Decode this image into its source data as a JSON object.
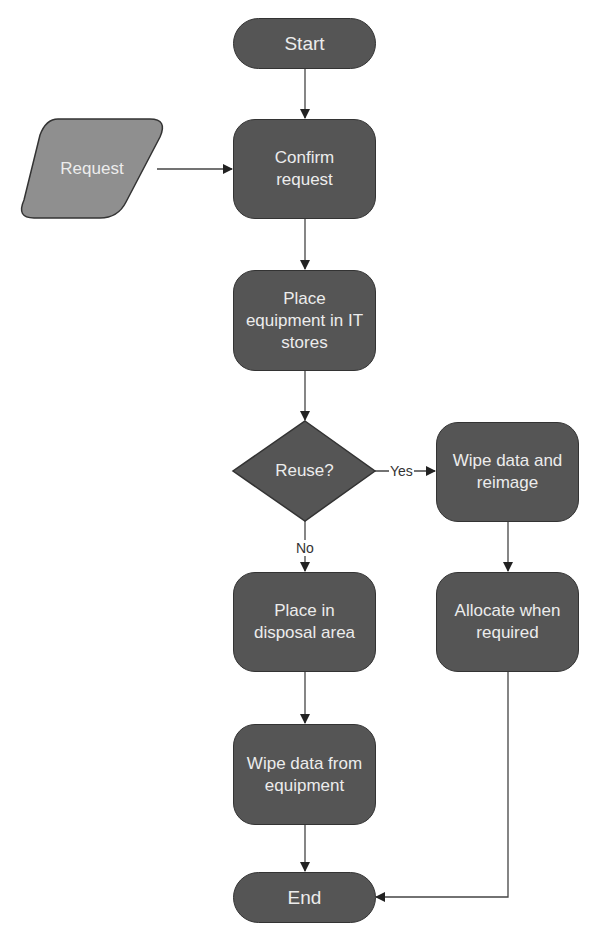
{
  "diagram": {
    "type": "flowchart",
    "colors": {
      "process_fill": "#555555",
      "input_fill": "#8f8f8f",
      "stroke": "#333333",
      "text": "#ececec",
      "connector": "#333333"
    },
    "nodes": {
      "start": {
        "label": "Start",
        "shape": "terminal"
      },
      "request": {
        "label": "Request",
        "shape": "parallelogram"
      },
      "confirm": {
        "label": "Confirm request",
        "shape": "process"
      },
      "place_stores": {
        "label": "Place equipment in IT stores",
        "shape": "process"
      },
      "reuse": {
        "label": "Reuse?",
        "shape": "decision"
      },
      "wipe_reimage": {
        "label": "Wipe data and reimage",
        "shape": "process"
      },
      "allocate": {
        "label": "Allocate when required",
        "shape": "process"
      },
      "disposal": {
        "label": "Place in disposal area",
        "shape": "process"
      },
      "wipe_equipment": {
        "label": "Wipe data from equipment",
        "shape": "process"
      },
      "end": {
        "label": "End",
        "shape": "terminal"
      }
    },
    "edges": [
      {
        "from": "start",
        "to": "confirm",
        "label": ""
      },
      {
        "from": "request",
        "to": "confirm",
        "label": ""
      },
      {
        "from": "confirm",
        "to": "place_stores",
        "label": ""
      },
      {
        "from": "place_stores",
        "to": "reuse",
        "label": ""
      },
      {
        "from": "reuse",
        "to": "wipe_reimage",
        "label": "Yes"
      },
      {
        "from": "reuse",
        "to": "disposal",
        "label": "No"
      },
      {
        "from": "wipe_reimage",
        "to": "allocate",
        "label": ""
      },
      {
        "from": "disposal",
        "to": "wipe_equipment",
        "label": ""
      },
      {
        "from": "wipe_equipment",
        "to": "end",
        "label": ""
      },
      {
        "from": "allocate",
        "to": "end",
        "label": ""
      }
    ],
    "edge_labels": {
      "yes": "Yes",
      "no": "No"
    }
  }
}
